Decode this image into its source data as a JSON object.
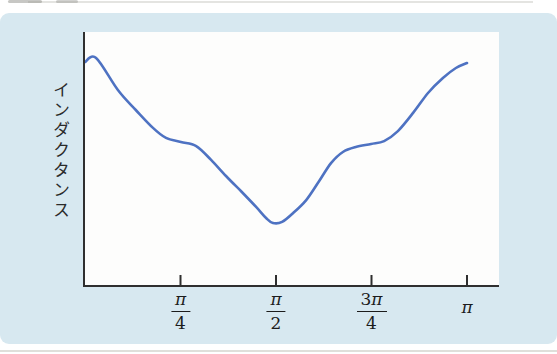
{
  "figure": {
    "card_color": "#d7e8f0",
    "plot_background": "#fdfdfc",
    "axis_color": "#2f2f2f",
    "label_color": "#2b2b2b",
    "tick_label_color": "#1c1c1c"
  },
  "chart_data": {
    "type": "line",
    "title": "",
    "xlabel": "",
    "ylabel": "インダクタンス",
    "x_unit": "fraction of π (angle 0 to π)",
    "x_range": [
      0,
      1
    ],
    "y_range_displayed": [
      0,
      1.11
    ],
    "y_axis_numeric": false,
    "grid": false,
    "legend": "none",
    "x_ticks": [
      {
        "value": 0.25,
        "numerator": "π",
        "denominator": "4"
      },
      {
        "value": 0.5,
        "numerator": "π",
        "denominator": "2"
      },
      {
        "value": 0.75,
        "numerator": "3π",
        "denominator": "4"
      },
      {
        "value": 1.0,
        "numerator": "π",
        "denominator": ""
      }
    ],
    "series": [
      {
        "name": "inductance-vs-angle",
        "color": "#4e72c2",
        "stroke_width": 2.6,
        "points": [
          [
            0.0,
            0.982
          ],
          [
            0.029,
            1.0
          ],
          [
            0.086,
            0.859
          ],
          [
            0.133,
            0.771
          ],
          [
            0.178,
            0.692
          ],
          [
            0.212,
            0.648
          ],
          [
            0.251,
            0.63
          ],
          [
            0.291,
            0.612
          ],
          [
            0.33,
            0.551
          ],
          [
            0.369,
            0.48
          ],
          [
            0.408,
            0.414
          ],
          [
            0.448,
            0.344
          ],
          [
            0.474,
            0.295
          ],
          [
            0.492,
            0.273
          ],
          [
            0.516,
            0.278
          ],
          [
            0.545,
            0.317
          ],
          [
            0.579,
            0.374
          ],
          [
            0.613,
            0.458
          ],
          [
            0.644,
            0.537
          ],
          [
            0.675,
            0.586
          ],
          [
            0.709,
            0.608
          ],
          [
            0.749,
            0.621
          ],
          [
            0.783,
            0.634
          ],
          [
            0.819,
            0.678
          ],
          [
            0.859,
            0.758
          ],
          [
            0.898,
            0.846
          ],
          [
            0.937,
            0.912
          ],
          [
            0.971,
            0.956
          ],
          [
            1.0,
            0.978
          ]
        ]
      }
    ]
  }
}
